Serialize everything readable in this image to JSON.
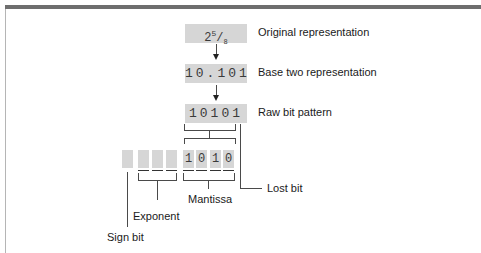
{
  "figure": {
    "rows": [
      {
        "box_text_whole": "2",
        "box_text_num": "5",
        "box_text_sep": "/",
        "box_text_den": "8",
        "label": "Original representation"
      },
      {
        "box_text": "10.101",
        "label": "Base two representation"
      },
      {
        "box_text": "10101",
        "label": "Raw bit pattern"
      }
    ],
    "storage": {
      "sign_cells": [
        ""
      ],
      "exponent_cells": [
        "",
        "",
        ""
      ],
      "mantissa_cells": [
        "1",
        "0",
        "1",
        "0"
      ]
    },
    "callouts": {
      "lost_bit": "Lost bit",
      "mantissa": "Mantissa",
      "exponent": "Exponent",
      "sign_bit": "Sign bit"
    }
  }
}
